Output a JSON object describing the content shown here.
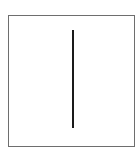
{
  "figure": {
    "shape": "rectangle-with-vertical-line",
    "border_color": "#6e6e6e",
    "line_color": "#1a1a1a"
  }
}
